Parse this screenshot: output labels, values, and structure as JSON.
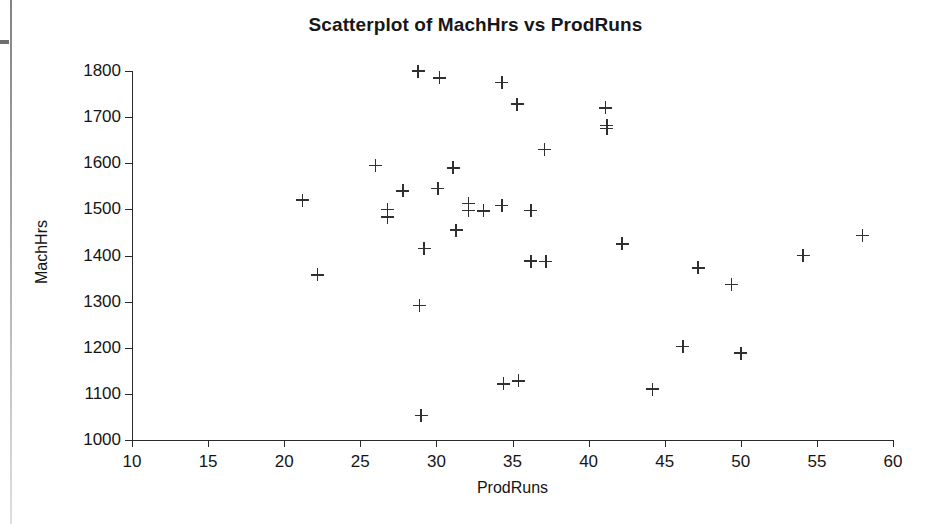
{
  "chart_data": {
    "type": "scatter",
    "title": "Scatterplot of MachHrs vs ProdRuns",
    "xlabel": "ProdRuns",
    "ylabel": "MachHrs",
    "xlim": [
      10,
      60
    ],
    "ylim": [
      1000,
      1800
    ],
    "xticks": [
      10,
      15,
      20,
      25,
      30,
      35,
      40,
      45,
      50,
      55,
      60
    ],
    "yticks": [
      1000,
      1100,
      1200,
      1300,
      1400,
      1500,
      1600,
      1700,
      1800
    ],
    "grid": false,
    "legend": false,
    "marker": "plus-cross",
    "marker_color": "#303030",
    "points": [
      {
        "x": 21.2,
        "y": 1520
      },
      {
        "x": 22.2,
        "y": 1358
      },
      {
        "x": 26.0,
        "y": 1595
      },
      {
        "x": 26.8,
        "y": 1500
      },
      {
        "x": 26.8,
        "y": 1483
      },
      {
        "x": 27.8,
        "y": 1540
      },
      {
        "x": 28.8,
        "y": 1800
      },
      {
        "x": 28.9,
        "y": 1292
      },
      {
        "x": 29.0,
        "y": 1053
      },
      {
        "x": 29.2,
        "y": 1415
      },
      {
        "x": 30.2,
        "y": 1785
      },
      {
        "x": 30.1,
        "y": 1545
      },
      {
        "x": 31.1,
        "y": 1590
      },
      {
        "x": 31.3,
        "y": 1455
      },
      {
        "x": 32.1,
        "y": 1513
      },
      {
        "x": 32.1,
        "y": 1498
      },
      {
        "x": 33.1,
        "y": 1497
      },
      {
        "x": 34.3,
        "y": 1775
      },
      {
        "x": 34.3,
        "y": 1508
      },
      {
        "x": 34.4,
        "y": 1122
      },
      {
        "x": 35.3,
        "y": 1728
      },
      {
        "x": 35.4,
        "y": 1128
      },
      {
        "x": 36.2,
        "y": 1498
      },
      {
        "x": 36.2,
        "y": 1388
      },
      {
        "x": 37.2,
        "y": 1387
      },
      {
        "x": 37.1,
        "y": 1630
      },
      {
        "x": 41.1,
        "y": 1720
      },
      {
        "x": 41.2,
        "y": 1682
      },
      {
        "x": 41.2,
        "y": 1675
      },
      {
        "x": 42.2,
        "y": 1425
      },
      {
        "x": 44.2,
        "y": 1110
      },
      {
        "x": 46.2,
        "y": 1203
      },
      {
        "x": 47.2,
        "y": 1373
      },
      {
        "x": 49.4,
        "y": 1337
      },
      {
        "x": 50.0,
        "y": 1188
      },
      {
        "x": 54.1,
        "y": 1400
      },
      {
        "x": 58.0,
        "y": 1443
      }
    ]
  },
  "scan": {
    "edge_artifact": "page-edge-line"
  }
}
